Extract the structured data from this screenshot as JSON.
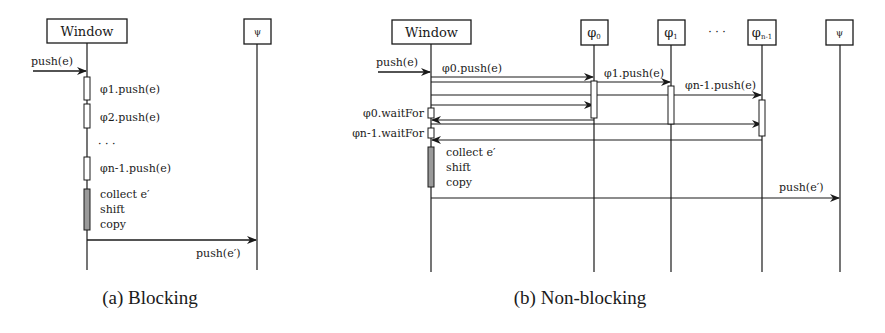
{
  "figure": {
    "panels": [
      {
        "id": "a",
        "caption": "(a) Blocking",
        "participants": [
          {
            "label": "Window",
            "x": 87
          },
          {
            "label": "ψ",
            "x": 257
          }
        ],
        "incoming": "push(e)",
        "steps": [
          "φ1.push(e)",
          "φ2.push(e)",
          "· · ·",
          "φn-1.push(e)"
        ],
        "local_ops": [
          "collect e′",
          "shift",
          "copy"
        ],
        "outgoing": "push(e′)"
      },
      {
        "id": "b",
        "caption": "(b) Non-blocking",
        "participants": [
          {
            "label": "Window",
            "x": 431
          },
          {
            "label": "φ0",
            "x": 594
          },
          {
            "label": "φ1",
            "x": 671
          },
          {
            "label": "φn-1",
            "x": 762
          },
          {
            "label": "ψ",
            "x": 840
          }
        ],
        "ellipsis": "· · ·",
        "incoming": "push(e)",
        "messages": [
          "φ0.push(e)",
          "φ1.push(e)",
          "φn-1.push(e)"
        ],
        "waits": [
          "φ0.waitFor",
          "φn-1.waitFor"
        ],
        "local_ops": [
          "collect e′",
          "shift",
          "copy"
        ],
        "outgoing": "push(e′)"
      }
    ]
  },
  "text": {
    "a_window": "Window",
    "a_psi": "ψ",
    "a_push_in": "push(e)",
    "a_step1": "φ1.push(e)",
    "a_step2": "φ2.push(e)",
    "a_dots": "· · ·",
    "a_step3": "φn-1.push(e)",
    "a_op1": "collect e′",
    "a_op2": "shift",
    "a_op3": "copy",
    "a_push_out": "push(e′)",
    "a_caption": "(a) Blocking",
    "b_window": "Window",
    "b_phi0": "φ",
    "b_phi0_sub": "0",
    "b_phi1": "φ",
    "b_phi1_sub": "1",
    "b_dots": "· · ·",
    "b_phin": "φ",
    "b_phin_sub": "n-1",
    "b_psi": "ψ",
    "b_push_in": "push(e)",
    "b_msg0": "φ0.push(e)",
    "b_msg1": "φ1.push(e)",
    "b_msg2": "φn-1.push(e)",
    "b_wait0": "φ0.waitFor",
    "b_wait1": "φn-1.waitFor",
    "b_op1": "collect e′",
    "b_op2": "shift",
    "b_op3": "copy",
    "b_push_out": "push(e′)",
    "b_caption": "(b) Non-blocking"
  },
  "colors": {
    "ink": "#1a1a1a",
    "activation_fill": "#ffffff",
    "compute_fill": "#9a9a9a"
  }
}
